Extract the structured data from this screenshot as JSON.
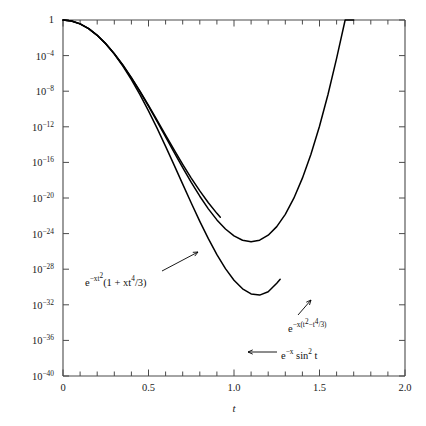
{
  "figure": {
    "title": "",
    "x_axis_title": "t"
  },
  "chart_data": {
    "type": "line",
    "title": "",
    "xlabel": "t",
    "ylabel": "",
    "yscale": "log",
    "xlim": [
      0,
      2.0
    ],
    "ylim": [
      1e-40,
      1
    ],
    "grid": false,
    "legend": "annotations",
    "x_ticks": [
      "0",
      "0.5",
      "1.0",
      "1.5",
      "2.0"
    ],
    "x_tick_values": [
      0,
      0.5,
      1.0,
      1.5,
      2.0
    ],
    "x_minor_step": 0.1,
    "y_ticks": [
      "1",
      "10-4",
      "10-8",
      "10-12",
      "10-16",
      "10-20",
      "10-24",
      "10-28",
      "10-32",
      "10-36",
      "10-40"
    ],
    "y_tick_exponents": [
      0,
      -4,
      -8,
      -12,
      -16,
      -20,
      -24,
      -28,
      -32,
      -36,
      -40
    ],
    "x_param": 100,
    "series": [
      {
        "name": "e^{-x t^2}(1 + x t^4/3)",
        "formula": "exp(-x*t^2)*(1 + x*t^4/3)",
        "x_start": 0.0,
        "x_end": 1.76,
        "points_t": [
          0.0,
          0.05,
          0.1,
          0.15,
          0.2,
          0.25,
          0.3,
          0.35,
          0.4,
          0.45,
          0.5,
          0.55,
          0.6,
          0.65,
          0.7,
          0.75,
          0.8,
          0.85,
          0.9,
          0.95,
          1.0,
          1.05,
          1.1,
          1.15,
          1.2,
          1.25,
          1.3,
          1.35,
          1.4,
          1.45,
          1.5,
          1.55,
          1.6,
          1.65,
          1.7,
          1.76
        ],
        "points_log10y": [
          0.0,
          -0.108,
          -0.432,
          -0.971,
          -1.719,
          -2.664,
          -3.789,
          -5.076,
          -6.503,
          -8.048,
          -9.685,
          -11.388,
          -13.128,
          -14.874,
          -16.592,
          -18.247,
          -19.801,
          -21.218,
          -22.459,
          -23.486,
          -24.262,
          -24.752,
          -24.92,
          -24.737,
          -24.176,
          -23.214,
          -21.834,
          -20.023,
          -17.771,
          -15.074,
          -11.931,
          -8.345,
          -4.32,
          0.137,
          5.01
        ]
      },
      {
        "name": "e^{-x(t^2 - t^4/3)}",
        "formula": "exp(-x*(t^2 - t^4/3))",
        "x_start": 0.0,
        "x_end": 1.27,
        "points_t": [
          0.0,
          0.05,
          0.1,
          0.15,
          0.2,
          0.25,
          0.3,
          0.35,
          0.4,
          0.45,
          0.5,
          0.55,
          0.6,
          0.65,
          0.7,
          0.75,
          0.8,
          0.85,
          0.9,
          0.95,
          1.0,
          1.05,
          1.1,
          1.15,
          1.2,
          1.25,
          1.27
        ],
        "points_log10y": [
          0.0,
          -0.108,
          -0.433,
          -0.972,
          -1.722,
          -2.677,
          -3.83,
          -5.173,
          -6.693,
          -8.376,
          -10.203,
          -12.152,
          -14.196,
          -16.304,
          -18.439,
          -20.56,
          -22.621,
          -24.573,
          -26.364,
          -27.938,
          -29.238,
          -30.206,
          -30.782,
          -30.909,
          -30.528,
          -29.585,
          -29.142
        ]
      },
      {
        "name": "e^{-x sin^2 t}",
        "formula": "exp(-x*sin(t)^2)",
        "x_start": 0.0,
        "x_end": 0.92,
        "points_t": [
          0.0,
          0.05,
          0.1,
          0.15,
          0.2,
          0.25,
          0.3,
          0.35,
          0.4,
          0.45,
          0.5,
          0.55,
          0.6,
          0.65,
          0.7,
          0.75,
          0.8,
          0.85,
          0.9,
          0.92
        ],
        "points_log10y": [
          0.0,
          -0.109,
          -0.433,
          -0.97,
          -1.715,
          -2.657,
          -3.779,
          -5.06,
          -6.477,
          -8.002,
          -9.608,
          -11.263,
          -12.936,
          -14.596,
          -16.213,
          -17.757,
          -19.205,
          -20.534,
          -21.726,
          -22.16
        ]
      }
    ],
    "annotations": [
      {
        "id": "annotation-curve-1",
        "text_html": "e<sup>−xt<sup>2</sup></sup>(1 + xt<sup>4</sup>/3)",
        "text_plain": "e^-xt^2 (1 + xt^4/3)",
        "label_x_px": 85,
        "label_y_px": 272,
        "leader_from_px": [
          162,
          271
        ],
        "leader_to_px": [
          198,
          252
        ]
      },
      {
        "id": "annotation-curve-2",
        "text_html": "e<sup>−x(t<sup>2</sup>−t<sup>4</sup>/3)</sup>",
        "text_plain": "e^-x(t^2 - t^4/3)",
        "label_x_px": 288,
        "label_y_px": 318,
        "leader_from_px": [
          298,
          315
        ],
        "leader_to_px": [
          311,
          300
        ]
      },
      {
        "id": "annotation-curve-3",
        "text_html": "e<sup>−x</sup> sin<sup>2</sup> t",
        "text_plain": "e^-x sin^2 t",
        "label_x_px": 281,
        "label_y_px": 348,
        "leader_from_px": [
          277,
          352
        ],
        "leader_to_px": [
          248,
          352
        ]
      }
    ]
  },
  "colors": {
    "curve": "#000000",
    "axis": "#4a4a4a",
    "text": "#1a1a1a",
    "background": "#ffffff"
  }
}
